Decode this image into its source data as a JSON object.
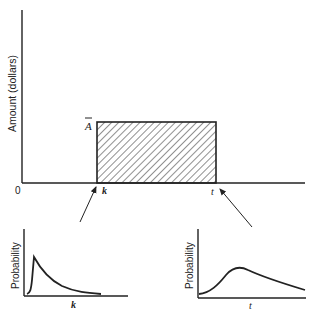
{
  "main_plot": {
    "ylabel": "Amount (dollars)",
    "origin_label": "0",
    "level_label": "A",
    "level_overbar": true,
    "start_label": "k",
    "end_label": "t",
    "region": "hatched rectangle from k to t with height A-bar"
  },
  "left_subplot": {
    "ylabel": "Probability",
    "xlabel": "k",
    "shape": "sharp early peak then exponential decay"
  },
  "right_subplot": {
    "ylabel": "Probability",
    "xlabel": "t",
    "shape": "gradual rise to broad peak then slow decline"
  },
  "arrows": [
    {
      "from": "left_subplot",
      "to": "start_label k"
    },
    {
      "from": "right_subplot",
      "to": "end_label t"
    }
  ],
  "colors": {
    "ink": "#222222",
    "background": "#ffffff"
  }
}
